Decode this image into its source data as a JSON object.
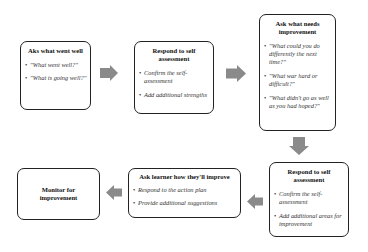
{
  "diagram": {
    "arrow_color": "#8a8a8a",
    "boxes": [
      {
        "title": "Aks what went well",
        "items": [
          "\"What went well?\"",
          "\"What is going well?\""
        ]
      },
      {
        "title": "Respond to self assessment",
        "items": [
          "Confirm the self-assessment",
          "Add additional strengths"
        ]
      },
      {
        "title": "Ask what needs improvement",
        "items": [
          "\"What could you do differently the next time?\"",
          "\"What war hard or difficult?\"",
          "\"What didn't go as well as you had hoped?\""
        ]
      },
      {
        "title": "Respond to self assessment",
        "items": [
          "Confirm the self-assessment",
          "Add additional areas for improvement"
        ]
      },
      {
        "title": "Ask learner how they'll improve",
        "items": [
          "Respond to the action plan",
          "Provide additional suggestions"
        ]
      },
      {
        "title": "Monitor for improvement",
        "items": []
      }
    ]
  }
}
